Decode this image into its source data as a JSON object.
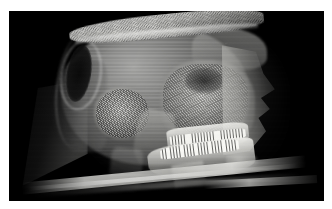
{
  "viewer": {
    "modality": "cbct-volume-render",
    "view": "lateral-right",
    "background_color": "#000000",
    "page_background_color": "#ffffff",
    "bounds": {
      "x": 9,
      "y": 11,
      "width": 315,
      "height": 190
    }
  },
  "annotations": {
    "top_right": {
      "line1": "",
      "line2": ""
    },
    "bottom_right": {
      "line1": "",
      "line2": ""
    },
    "bottom_left": {
      "line1": "",
      "line2": ""
    }
  },
  "anatomy": {
    "scalp": "scalp-hair-surface",
    "cranial_vault": "cranial-vault",
    "occipital": "occipital-region",
    "temporal_bone": "temporal-petrous-bone",
    "orbit": "orbital-socket",
    "midface": "maxillofacial-complex",
    "nasal_profile": "soft-tissue-facial-profile",
    "maxilla": "maxilla-upper-dental-arch",
    "mandible": "mandible-lower-dental-arch",
    "cervical_spine": "cervical-spine",
    "headrest": "scanner-headrest-table"
  }
}
